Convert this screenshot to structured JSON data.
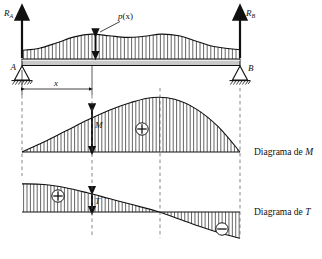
{
  "figure": {
    "type": "structural-beam-diagram",
    "language": "es",
    "title_visible": false
  },
  "beam": {
    "support_left_label": "A",
    "support_right_label": "B",
    "support_left_type": "pin-hatched",
    "support_right_type": "pin-hatched",
    "reaction_left": {
      "symbol": "R",
      "subscript": "A",
      "direction": "up"
    },
    "reaction_right": {
      "symbol": "R",
      "subscript": "B",
      "direction": "up"
    },
    "load_label": "p(x)",
    "load_label_symbol": "p",
    "load_label_arg": "(x)",
    "distance_label": "x",
    "span_px": 218
  },
  "diagrams": [
    {
      "id": "moment",
      "caption_prefix": "Diagrama de ",
      "caption_symbol": "M",
      "ordinate_label": "M",
      "sign_symbol": "⊕",
      "sign_name": "plus-circle",
      "regions": [
        {
          "sign": "positive",
          "from": 0.0,
          "to": 1.0
        }
      ]
    },
    {
      "id": "shear",
      "caption_prefix": "Diagrama de ",
      "caption_symbol": "T",
      "ordinate_label": "T",
      "sign_symbol_positive": "⊕",
      "sign_symbol_negative": "⊖",
      "sign_name_positive": "plus-circle",
      "sign_name_negative": "minus-circle",
      "regions": [
        {
          "sign": "positive",
          "from": 0.0,
          "to": 0.63
        },
        {
          "sign": "negative",
          "from": 0.63,
          "to": 1.0
        }
      ]
    }
  ],
  "colors": {
    "ink": "#111111",
    "beam_fill": "#c9c9c9",
    "hatch": "#222222",
    "paper": "#ffffff"
  },
  "chart_data": {
    "type": "line",
    "title": "",
    "xlabel": "x",
    "ylabel": "",
    "grid": false,
    "legend": "none",
    "panels": [
      {
        "name": "load",
        "series_name": "p(x)",
        "x": [
          0.0,
          0.08,
          0.16,
          0.24,
          0.32,
          0.4,
          0.48,
          0.56,
          0.64,
          0.72,
          0.8,
          0.88,
          1.0
        ],
        "y": [
          0.32,
          0.4,
          0.6,
          0.82,
          0.92,
          0.86,
          0.8,
          0.84,
          0.92,
          0.86,
          0.66,
          0.46,
          0.34
        ]
      },
      {
        "name": "moment",
        "series_name": "M",
        "x": [
          0.0,
          0.1,
          0.2,
          0.3,
          0.4,
          0.5,
          0.6,
          0.7,
          0.8,
          0.9,
          1.0
        ],
        "y": [
          0.0,
          0.18,
          0.38,
          0.58,
          0.76,
          0.9,
          0.99,
          0.96,
          0.78,
          0.46,
          0.0
        ]
      },
      {
        "name": "shear",
        "series_name": "T",
        "x": [
          0.0,
          0.1,
          0.2,
          0.3,
          0.4,
          0.5,
          0.63,
          0.72,
          0.82,
          0.92,
          1.0
        ],
        "y": [
          0.88,
          0.86,
          0.76,
          0.6,
          0.42,
          0.24,
          0.0,
          -0.22,
          -0.46,
          -0.68,
          -0.82
        ]
      }
    ]
  }
}
